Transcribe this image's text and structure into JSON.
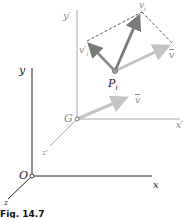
{
  "figure": {
    "caption": "Fig. 14.7",
    "colors": {
      "axis_dark": "#222222",
      "axis_light": "#a8a8a8",
      "vector_light": "#c4c4c4",
      "vector_dark": "#7a7a7a",
      "dashed": "#333333"
    },
    "global_axes": {
      "origin_label": "O",
      "x_label": "x",
      "y_label": "y",
      "z_label": "z"
    },
    "centroid_frame": {
      "origin_label": "G",
      "x_label": "x′",
      "y_label": "y′",
      "z_label": "z′",
      "velocity_label": "v"
    },
    "particle": {
      "label": "P",
      "subscript": "i",
      "absolute_velocity_label": "v",
      "absolute_velocity_subscript": "i",
      "relative_velocity_label": "v′",
      "relative_velocity_subscript": "i",
      "mean_velocity_label": "v"
    }
  }
}
